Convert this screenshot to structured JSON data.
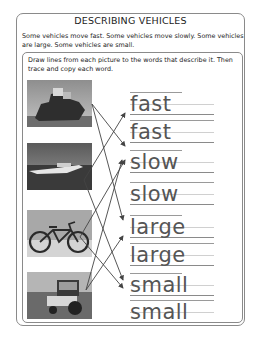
{
  "worksheet": {
    "title": "DESCRIBING VEHICLES",
    "intro": "Some vehicles move fast.  Some vehicles move slowly.  Some vehicles are large.  Some vehicles are small.",
    "instructions": "Draw lines from each picture to the words that describe it.  Then trace and copy each word.",
    "pictures": [
      {
        "name": "ship",
        "description": "large cargo ship at sea"
      },
      {
        "name": "speedboat",
        "description": "speedboat on water"
      },
      {
        "name": "bicycle",
        "description": "bicycle"
      },
      {
        "name": "tractor",
        "description": "tractor in a field"
      }
    ],
    "words": [
      {
        "label": "fast",
        "kind": "trace"
      },
      {
        "label": "fast",
        "kind": "copy"
      },
      {
        "label": "slow",
        "kind": "trace"
      },
      {
        "label": "slow",
        "kind": "copy"
      },
      {
        "label": "large",
        "kind": "trace"
      },
      {
        "label": "large",
        "kind": "copy"
      },
      {
        "label": "small",
        "kind": "trace"
      },
      {
        "label": "small",
        "kind": "copy"
      }
    ],
    "connections": [
      {
        "from": "ship",
        "to": "slow"
      },
      {
        "from": "ship",
        "to": "large"
      },
      {
        "from": "speedboat",
        "to": "fast"
      },
      {
        "from": "speedboat",
        "to": "small"
      },
      {
        "from": "bicycle",
        "to": "slow"
      },
      {
        "from": "bicycle",
        "to": "small"
      },
      {
        "from": "tractor",
        "to": "slow"
      },
      {
        "from": "tractor",
        "to": "large"
      }
    ],
    "colors": {
      "border": "#8a8a8a",
      "text": "#222222",
      "trace_text": "#555555",
      "line": "#444444"
    }
  }
}
